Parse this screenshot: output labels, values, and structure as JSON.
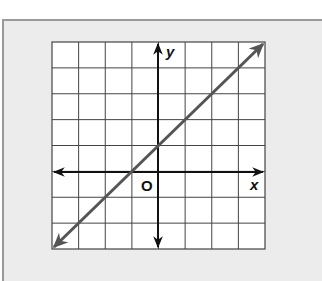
{
  "figure": {
    "type": "coordinate-plane-line-graph",
    "x_axis_label": "x",
    "y_axis_label": "y",
    "origin_label": "O",
    "grid": {
      "columns": 8,
      "rows": 8,
      "x_range": [
        -4,
        4
      ],
      "y_range": [
        -3,
        5
      ]
    },
    "line": {
      "equation": "y = x + 1",
      "slope": 1,
      "y_intercept": 1,
      "x_intercept": -1,
      "from": [
        -4,
        -3
      ],
      "to": [
        4,
        5
      ],
      "color": "#555555"
    },
    "colors": {
      "panel_bg": "#ececec",
      "panel_border": "#9a9a9a",
      "grid_bg": "#ffffff",
      "grid_line": "#444444",
      "axis": "#111111"
    }
  }
}
